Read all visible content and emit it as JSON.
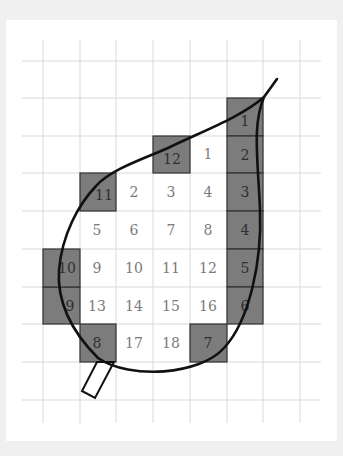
{
  "diagram": {
    "title": "",
    "colors": {
      "background": "#f0f0f0",
      "panel": "#ffffff",
      "grid": "#d9d9d9",
      "shaded_fill": "#7c7c7c",
      "shaded_border": "#333333",
      "outline": "#111111",
      "plain_number": "#7a7a7a",
      "shaded_number": "#2e2e2e"
    },
    "grid": {
      "columns": 7,
      "rows": 9,
      "cell_width_px": 36.7,
      "cell_height_px": 37.6
    },
    "whole_squares": [
      {
        "label": "1",
        "col": 4,
        "row": 2
      },
      {
        "label": "2",
        "col": 2,
        "row": 3
      },
      {
        "label": "3",
        "col": 3,
        "row": 3
      },
      {
        "label": "4",
        "col": 4,
        "row": 3
      },
      {
        "label": "5",
        "col": 1,
        "row": 4
      },
      {
        "label": "6",
        "col": 2,
        "row": 4
      },
      {
        "label": "7",
        "col": 3,
        "row": 4
      },
      {
        "label": "8",
        "col": 4,
        "row": 4
      },
      {
        "label": "9",
        "col": 1,
        "row": 5
      },
      {
        "label": "10",
        "col": 2,
        "row": 5
      },
      {
        "label": "11",
        "col": 3,
        "row": 5
      },
      {
        "label": "12",
        "col": 4,
        "row": 5
      },
      {
        "label": "13",
        "col": 1,
        "row": 6
      },
      {
        "label": "14",
        "col": 2,
        "row": 6
      },
      {
        "label": "15",
        "col": 3,
        "row": 6
      },
      {
        "label": "16",
        "col": 4,
        "row": 6
      },
      {
        "label": "17",
        "col": 2,
        "row": 7
      },
      {
        "label": "18",
        "col": 3,
        "row": 7
      }
    ],
    "partial_squares": [
      {
        "label": "1",
        "col": 5,
        "row": 1
      },
      {
        "label": "2",
        "col": 5,
        "row": 2
      },
      {
        "label": "3",
        "col": 5,
        "row": 3
      },
      {
        "label": "4",
        "col": 5,
        "row": 4
      },
      {
        "label": "5",
        "col": 5,
        "row": 5
      },
      {
        "label": "6",
        "col": 5,
        "row": 6
      },
      {
        "label": "7",
        "col": 4,
        "row": 7
      },
      {
        "label": "8",
        "col": 1,
        "row": 7
      },
      {
        "label": "9",
        "col": 0,
        "row": 6
      },
      {
        "label": "10",
        "col": 0,
        "row": 5
      },
      {
        "label": "11",
        "col": 1,
        "row": 3
      },
      {
        "label": "12",
        "col": 3,
        "row": 2
      }
    ],
    "counts": {
      "whole": "18",
      "partial": "12"
    }
  }
}
